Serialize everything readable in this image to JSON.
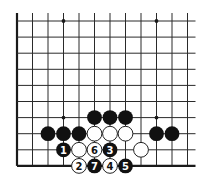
{
  "diagram": {
    "type": "go-board-fragment",
    "grid": {
      "columns": 12,
      "rows": 10,
      "x0": 17,
      "dx": 15.5,
      "y0": 21,
      "dy": 16.1,
      "left_edge": true,
      "bottom_edge": true,
      "top_open": true,
      "right_open": true
    },
    "star_points": [
      {
        "col": 3,
        "row": 0
      },
      {
        "col": 9,
        "row": 0
      },
      {
        "col": 3,
        "row": 6
      },
      {
        "col": 9,
        "row": 6
      }
    ],
    "stones": [
      {
        "color": "black",
        "col": 5,
        "row": 6,
        "label": ""
      },
      {
        "color": "black",
        "col": 6,
        "row": 6,
        "label": ""
      },
      {
        "color": "black",
        "col": 7,
        "row": 6,
        "label": ""
      },
      {
        "color": "black",
        "col": 2,
        "row": 7,
        "label": ""
      },
      {
        "color": "black",
        "col": 3,
        "row": 7,
        "label": ""
      },
      {
        "color": "black",
        "col": 4,
        "row": 7,
        "label": ""
      },
      {
        "color": "white",
        "col": 5,
        "row": 7,
        "label": ""
      },
      {
        "color": "white",
        "col": 6,
        "row": 7,
        "label": ""
      },
      {
        "color": "white",
        "col": 7,
        "row": 7,
        "label": ""
      },
      {
        "color": "black",
        "col": 9,
        "row": 7,
        "label": ""
      },
      {
        "color": "black",
        "col": 10,
        "row": 7,
        "label": ""
      },
      {
        "color": "black",
        "col": 3,
        "row": 8,
        "label": "1"
      },
      {
        "color": "white",
        "col": 4,
        "row": 8,
        "label": ""
      },
      {
        "color": "white",
        "col": 5,
        "row": 8,
        "label": "6"
      },
      {
        "color": "black",
        "col": 6,
        "row": 8,
        "label": "3"
      },
      {
        "color": "white",
        "col": 8,
        "row": 8,
        "label": ""
      },
      {
        "color": "white",
        "col": 4,
        "row": 9,
        "label": "2"
      },
      {
        "color": "black",
        "col": 5,
        "row": 9,
        "label": "7"
      },
      {
        "color": "white",
        "col": 6,
        "row": 9,
        "label": "4"
      },
      {
        "color": "black",
        "col": 7,
        "row": 9,
        "label": "5"
      }
    ],
    "colors": {
      "background": "#ffffff",
      "line": "#2a2a2a",
      "black_stone": "#111111",
      "white_stone": "#ffffff"
    }
  }
}
